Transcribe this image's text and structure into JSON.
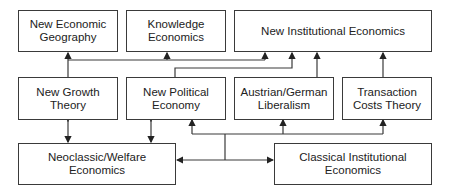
{
  "diagram": {
    "nodes": [
      {
        "id": "neg",
        "label": "New Economic\nGeography"
      },
      {
        "id": "ke",
        "label": "Knowledge\nEconomics"
      },
      {
        "id": "nie",
        "label": "New Institutional Economics"
      },
      {
        "id": "ngt",
        "label": "New Growth\nTheory"
      },
      {
        "id": "npe",
        "label": "New Political\nEconomy"
      },
      {
        "id": "agl",
        "label": "Austrian/German\nLiberalism"
      },
      {
        "id": "tct",
        "label": "Transaction\nCosts Theory"
      },
      {
        "id": "nwe",
        "label": "Neoclassic/Welfare\nEconomics"
      },
      {
        "id": "cie",
        "label": "Classical Institutional\nEconomics"
      }
    ],
    "edges": [
      {
        "from": "ngt",
        "to": "neg",
        "type": "directed"
      },
      {
        "from": "ngt",
        "to": "ke",
        "type": "directed"
      },
      {
        "from": "ngt",
        "to": "nie",
        "type": "directed"
      },
      {
        "from": "npe",
        "to": "nie",
        "type": "directed"
      },
      {
        "from": "agl",
        "to": "nie",
        "type": "directed"
      },
      {
        "from": "tct",
        "to": "nie",
        "type": "directed"
      },
      {
        "from": "ngt",
        "to": "nwe",
        "type": "bidirectional"
      },
      {
        "from": "npe",
        "to": "nwe",
        "type": "bidirectional"
      },
      {
        "from": "junction",
        "to": "nwe",
        "type": "directed"
      },
      {
        "from": "junction",
        "to": "cie",
        "type": "directed"
      },
      {
        "from": "junction",
        "to": "npe",
        "type": "directed"
      },
      {
        "from": "junction",
        "to": "agl",
        "type": "directed"
      },
      {
        "from": "junction",
        "to": "tct",
        "type": "directed"
      }
    ],
    "colors": {
      "line": "#3a3a3a",
      "background": "#ffffff"
    }
  }
}
